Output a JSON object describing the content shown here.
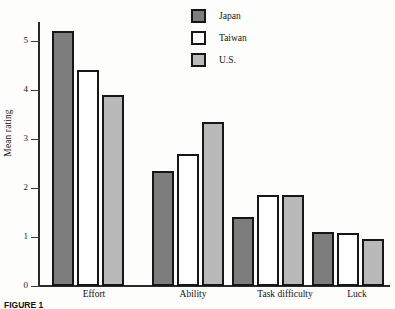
{
  "chart_data": {
    "type": "bar",
    "title": "",
    "xlabel": "",
    "ylabel": "Mean rating",
    "ylim": [
      0,
      5.45
    ],
    "yticks": [
      0,
      1,
      2,
      3,
      4,
      5
    ],
    "ytick_labels": [
      "0",
      "1",
      "2",
      "3",
      "4",
      "5"
    ],
    "grid": false,
    "legend_position": "top-center",
    "categories": [
      "Effort",
      "Ability",
      "Task difficulty",
      "Luck"
    ],
    "series": [
      {
        "name": "Japan",
        "color": "#7d7d7d",
        "values": [
          5.2,
          2.35,
          1.4,
          1.1
        ]
      },
      {
        "name": "Taiwan",
        "color": "#ffffff",
        "values": [
          4.4,
          2.7,
          1.85,
          1.08
        ]
      },
      {
        "name": "U.S.",
        "color": "#b9b9b9",
        "values": [
          3.9,
          3.35,
          1.85,
          0.95
        ]
      }
    ]
  },
  "legend": {
    "items": [
      {
        "label": "Japan",
        "swatch": "dark-gray"
      },
      {
        "label": "Taiwan",
        "swatch": "white"
      },
      {
        "label": "U.S.",
        "swatch": "light-gray"
      }
    ]
  },
  "axes": {
    "y_title": "Mean rating",
    "y_tick_labels": [
      "5",
      "4",
      "3",
      "2",
      "1",
      "0"
    ],
    "x_group_labels": [
      "Effort",
      "Ability",
      "Task difficulty",
      "Luck"
    ]
  },
  "caption": {
    "figure_number": "FIGURE 1",
    "figure_text": ""
  }
}
